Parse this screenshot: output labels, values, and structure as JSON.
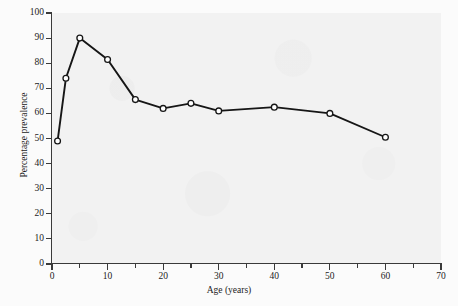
{
  "chart_data": {
    "type": "line",
    "title": "",
    "xlabel": "Age (years)",
    "ylabel": "Percentage prevalence",
    "xlim": [
      0,
      70
    ],
    "ylim": [
      0,
      100
    ],
    "xticks": [
      0,
      10,
      20,
      30,
      40,
      50,
      60,
      70
    ],
    "xticks_minor": [
      5,
      15,
      25,
      35,
      45,
      55,
      65
    ],
    "yticks": [
      0,
      10,
      20,
      30,
      40,
      50,
      60,
      70,
      80,
      90,
      100
    ],
    "grid": false,
    "legend": null,
    "marker": "open-circle",
    "series": [
      {
        "name": "Percentage prevalence",
        "x": [
          1,
          2.5,
          5,
          10,
          15,
          20,
          25,
          30,
          40,
          50,
          60
        ],
        "y": [
          49,
          74,
          90,
          81.5,
          65.5,
          62,
          64,
          61,
          62.5,
          60,
          50.5
        ]
      }
    ]
  },
  "axes": {
    "x_tick_labels": [
      "0",
      "10",
      "20",
      "30",
      "40",
      "50",
      "60",
      "70"
    ],
    "y_tick_labels": [
      "0",
      "10",
      "20",
      "30",
      "40",
      "50",
      "60",
      "70",
      "80",
      "90",
      "100"
    ],
    "x_title": "Age (years)",
    "y_title": "Percentage prevalence"
  },
  "style": {
    "line_color": "#161616",
    "marker_face": "#ffffff",
    "marker_edge": "#161616",
    "axis_color": "#3a3a3a",
    "plot_bg": "#f2f2f2",
    "page_bg": "#fbfbfb"
  }
}
